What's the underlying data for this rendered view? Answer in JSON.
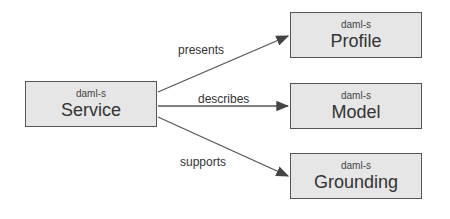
{
  "nodes": {
    "service": {
      "namespace": "daml-s",
      "name": "Service"
    },
    "profile": {
      "namespace": "daml-s",
      "name": "Profile"
    },
    "model": {
      "namespace": "daml-s",
      "name": "Model"
    },
    "grounding": {
      "namespace": "daml-s",
      "name": "Grounding"
    }
  },
  "edges": [
    {
      "from": "Service",
      "to": "Profile",
      "label": "presents"
    },
    {
      "from": "Service",
      "to": "Model",
      "label": "describes"
    },
    {
      "from": "Service",
      "to": "Grounding",
      "label": "supports"
    }
  ],
  "colors": {
    "box_fill": "#e6e6e6",
    "box_border": "#555555",
    "arrow": "#444444"
  }
}
